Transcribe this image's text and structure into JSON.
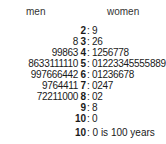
{
  "chart_data": {
    "type": "table",
    "subtype": "back-to-back stem-and-leaf plot",
    "left_label": "men",
    "right_label": "women",
    "rows": [
      {
        "stem": "2",
        "men": "",
        "women": "9"
      },
      {
        "stem": "3",
        "men": "8",
        "women": "26"
      },
      {
        "stem": "4",
        "men": "99863",
        "women": "1256778"
      },
      {
        "stem": "5",
        "men": "8633111110",
        "women": "01223345555889"
      },
      {
        "stem": "6",
        "men": "997666442",
        "women": "01236678"
      },
      {
        "stem": "7",
        "men": "9764411",
        "women": "0247"
      },
      {
        "stem": "8",
        "men": "72211000",
        "women": "02"
      },
      {
        "stem": "9",
        "men": "",
        "women": "8"
      },
      {
        "stem": "10",
        "men": "",
        "women": "0"
      }
    ],
    "key": {
      "stem": "10",
      "leaf": "0",
      "text": "0 is 100  years"
    }
  },
  "headers": {
    "men": "men",
    "women": "women"
  },
  "colon": ":",
  "legend": {
    "stem": "10",
    "text": ": 0 is 100  years"
  }
}
